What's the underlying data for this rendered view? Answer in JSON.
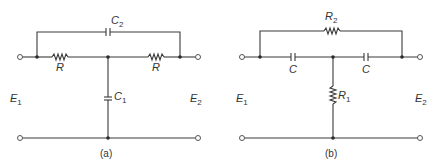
{
  "figure": {
    "circuit_a": {
      "caption": "(a)",
      "input_label": "E",
      "input_sub": "1",
      "output_label": "E",
      "output_sub": "2",
      "bridge_component": {
        "type": "capacitor",
        "label": "C",
        "sub": "2"
      },
      "series_left": {
        "type": "resistor",
        "label": "R"
      },
      "series_right": {
        "type": "resistor",
        "label": "R"
      },
      "shunt": {
        "type": "capacitor",
        "label": "C",
        "sub": "1"
      }
    },
    "circuit_b": {
      "caption": "(b)",
      "input_label": "E",
      "input_sub": "1",
      "output_label": "E",
      "output_sub": "2",
      "bridge_component": {
        "type": "resistor",
        "label": "R",
        "sub": "2"
      },
      "series_left": {
        "type": "capacitor",
        "label": "C"
      },
      "series_right": {
        "type": "capacitor",
        "label": "C"
      },
      "shunt": {
        "type": "resistor",
        "label": "R",
        "sub": "1"
      }
    }
  }
}
